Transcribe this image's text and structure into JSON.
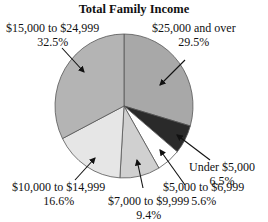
{
  "chart_data": {
    "type": "pie",
    "title": "Total Family Income",
    "categories": [
      "$25,000 and over",
      "Under $5,000",
      "$5,000 to $6,999",
      "$7,000 to $9,999",
      "$10,000 to $14,999",
      "$15,000 to $24,999"
    ],
    "values": [
      29.5,
      6.5,
      5.6,
      9.4,
      16.6,
      32.5
    ],
    "unit": "%",
    "colors": [
      "#a8a8a8",
      "#2a2a2a",
      "#ffffff",
      "#d0d0d0",
      "#e6e6e6",
      "#b4b4b4"
    ],
    "start_angle_deg": 0,
    "direction": "clockwise",
    "legend": "none (callout labels with arrows)"
  },
  "labels": [
    {
      "name": "$25,000 and over",
      "pct": "29.5%"
    },
    {
      "name": "Under $5,000",
      "pct": "6.5%"
    },
    {
      "name": "$5,000 to $6,999",
      "pct": "5.6%"
    },
    {
      "name": "$7,000 to $9,999",
      "pct": "9.4%"
    },
    {
      "name": "$10,000 to $14,999",
      "pct": "16.6%"
    },
    {
      "name": "$15,000 to $24,999",
      "pct": "32.5%"
    }
  ]
}
